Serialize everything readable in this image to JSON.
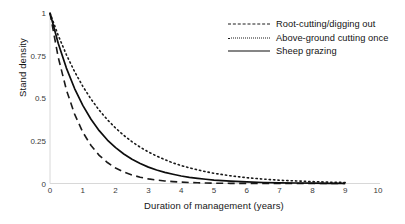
{
  "chart_data": {
    "type": "line",
    "title": "",
    "xlabel": "Duration of management (years)",
    "ylabel": "Stand density",
    "xlim": [
      0,
      10
    ],
    "ylim": [
      0,
      1
    ],
    "grid": false,
    "legend_position": "top-right",
    "xticks": [
      "0",
      "1",
      "2",
      "3",
      "4",
      "5",
      "6",
      "7",
      "8",
      "9",
      "10"
    ],
    "yticks": [
      "0",
      "0.25",
      "0.5",
      "0.75",
      "1"
    ],
    "x": [
      0,
      0.25,
      0.5,
      0.75,
      1,
      1.25,
      1.5,
      1.75,
      2,
      2.25,
      2.5,
      2.75,
      3,
      3.25,
      3.5,
      3.75,
      4,
      4.25,
      4.5,
      4.75,
      5,
      5.5,
      6,
      6.5,
      7,
      7.5,
      8,
      8.5,
      9
    ],
    "series": [
      {
        "name": "Root-cutting/digging out",
        "style": "dashed",
        "color": "#1a1a1a",
        "values": [
          1,
          0.741,
          0.549,
          0.407,
          0.301,
          0.223,
          0.165,
          0.123,
          0.091,
          0.067,
          0.05,
          0.037,
          0.027,
          0.02,
          0.015,
          0.011,
          0.008,
          0.006,
          0.004,
          0.003,
          0.002,
          0.001,
          0.001,
          0.0,
          0.0,
          0.0,
          0.0,
          0.0,
          0.0
        ]
      },
      {
        "name": "Above-ground cutting once",
        "style": "dotted",
        "color": "#1a1a1a",
        "values": [
          1,
          0.869,
          0.755,
          0.656,
          0.57,
          0.495,
          0.43,
          0.374,
          0.325,
          0.282,
          0.245,
          0.213,
          0.185,
          0.161,
          0.14,
          0.121,
          0.105,
          0.092,
          0.08,
          0.069,
          0.06,
          0.045,
          0.034,
          0.026,
          0.019,
          0.015,
          0.011,
          0.008,
          0.006
        ]
      },
      {
        "name": "Sheep grazing",
        "style": "solid",
        "color": "#0d0d0d",
        "values": [
          1,
          0.823,
          0.677,
          0.557,
          0.458,
          0.377,
          0.31,
          0.255,
          0.21,
          0.173,
          0.142,
          0.117,
          0.096,
          0.079,
          0.065,
          0.054,
          0.044,
          0.036,
          0.03,
          0.025,
          0.02,
          0.014,
          0.009,
          0.006,
          0.004,
          0.003,
          0.002,
          0.001,
          0.001
        ]
      }
    ]
  },
  "legend": {
    "items": [
      {
        "label": "Root-cutting/digging out"
      },
      {
        "label": "Above-ground cutting once"
      },
      {
        "label": "Sheep grazing"
      }
    ]
  }
}
